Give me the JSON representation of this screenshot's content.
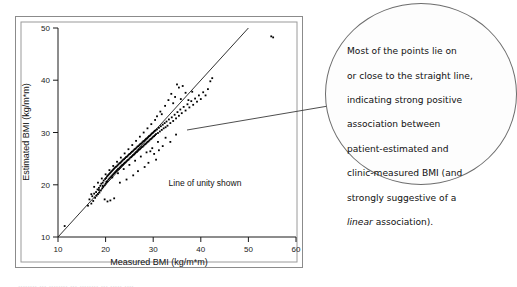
{
  "figure": {
    "background_color": "#ffffff",
    "frame_color": "#8b8b8b",
    "point_color": "#000000"
  },
  "chart_data": {
    "type": "scatter",
    "title": "",
    "xlabel": "Measured BMI (kg/m*m)",
    "ylabel": "Estimated BMI (kg/m*m)",
    "xlim": [
      10,
      60
    ],
    "ylim": [
      10,
      50
    ],
    "xticks": [
      10,
      20,
      30,
      40,
      50,
      60
    ],
    "yticks": [
      10,
      20,
      30,
      40,
      50
    ],
    "grid": false,
    "legend": "",
    "annotations": [
      {
        "text": "Line of unity shown",
        "x": 41,
        "y": 20.5
      }
    ],
    "reference_lines": [
      {
        "name": "line-of-unity",
        "type": "identity",
        "from": [
          10,
          10
        ],
        "to": [
          50,
          50
        ],
        "label": "Line of unity shown"
      }
    ],
    "series": [
      {
        "name": "patient-estimated vs clinic-measured BMI",
        "points": [
          [
            11.4,
            12.1
          ],
          [
            16.3,
            16.0
          ],
          [
            16.6,
            17.2
          ],
          [
            17.0,
            16.4
          ],
          [
            17.2,
            17.8
          ],
          [
            17.4,
            16.9
          ],
          [
            17.6,
            18.3
          ],
          [
            17.8,
            17.5
          ],
          [
            18.0,
            18.6
          ],
          [
            18.1,
            17.9
          ],
          [
            18.3,
            19.1
          ],
          [
            18.4,
            18.2
          ],
          [
            18.6,
            19.4
          ],
          [
            18.7,
            18.5
          ],
          [
            18.9,
            19.8
          ],
          [
            19.0,
            18.9
          ],
          [
            19.1,
            20.2
          ],
          [
            19.3,
            19.3
          ],
          [
            19.4,
            20.4
          ],
          [
            19.5,
            19.6
          ],
          [
            19.6,
            20.8
          ],
          [
            19.8,
            19.9
          ],
          [
            19.9,
            21.1
          ],
          [
            20.0,
            20.2
          ],
          [
            20.1,
            21.3
          ],
          [
            20.2,
            20.5
          ],
          [
            20.3,
            21.6
          ],
          [
            20.4,
            20.7
          ],
          [
            20.5,
            21.8
          ],
          [
            20.6,
            21.0
          ],
          [
            20.7,
            22.0
          ],
          [
            20.8,
            21.2
          ],
          [
            20.9,
            22.2
          ],
          [
            21.0,
            21.4
          ],
          [
            21.1,
            22.4
          ],
          [
            21.2,
            21.6
          ],
          [
            21.3,
            22.6
          ],
          [
            21.4,
            21.8
          ],
          [
            21.5,
            22.8
          ],
          [
            21.6,
            22.0
          ],
          [
            21.7,
            23.0
          ],
          [
            21.8,
            22.2
          ],
          [
            21.9,
            23.2
          ],
          [
            22.0,
            22.4
          ],
          [
            22.1,
            23.4
          ],
          [
            22.2,
            22.6
          ],
          [
            22.3,
            23.5
          ],
          [
            22.4,
            22.8
          ],
          [
            22.5,
            23.7
          ],
          [
            22.6,
            23.0
          ],
          [
            22.7,
            23.9
          ],
          [
            22.8,
            23.1
          ],
          [
            22.9,
            24.1
          ],
          [
            23.0,
            23.3
          ],
          [
            23.1,
            24.2
          ],
          [
            23.2,
            23.5
          ],
          [
            23.3,
            24.4
          ],
          [
            23.4,
            23.7
          ],
          [
            23.5,
            24.6
          ],
          [
            23.6,
            23.8
          ],
          [
            23.7,
            24.8
          ],
          [
            23.8,
            24.0
          ],
          [
            23.9,
            24.9
          ],
          [
            24.0,
            24.2
          ],
          [
            24.1,
            25.1
          ],
          [
            24.2,
            24.3
          ],
          [
            24.3,
            25.3
          ],
          [
            24.4,
            24.5
          ],
          [
            24.5,
            25.4
          ],
          [
            24.6,
            24.7
          ],
          [
            24.7,
            25.6
          ],
          [
            24.8,
            24.8
          ],
          [
            24.9,
            25.8
          ],
          [
            25.0,
            25.0
          ],
          [
            25.1,
            25.9
          ],
          [
            25.2,
            25.2
          ],
          [
            25.3,
            26.1
          ],
          [
            25.4,
            25.3
          ],
          [
            25.5,
            26.3
          ],
          [
            25.6,
            25.5
          ],
          [
            25.7,
            26.4
          ],
          [
            25.8,
            25.7
          ],
          [
            25.9,
            26.6
          ],
          [
            26.0,
            25.8
          ],
          [
            26.1,
            26.8
          ],
          [
            26.2,
            26.0
          ],
          [
            26.3,
            26.9
          ],
          [
            26.4,
            26.2
          ],
          [
            26.5,
            27.1
          ],
          [
            26.6,
            26.3
          ],
          [
            26.7,
            27.3
          ],
          [
            26.8,
            26.5
          ],
          [
            26.9,
            27.4
          ],
          [
            27.0,
            26.7
          ],
          [
            27.1,
            27.6
          ],
          [
            27.2,
            26.8
          ],
          [
            27.3,
            27.8
          ],
          [
            27.4,
            27.0
          ],
          [
            27.5,
            27.9
          ],
          [
            27.6,
            27.2
          ],
          [
            27.7,
            28.1
          ],
          [
            27.8,
            27.3
          ],
          [
            27.9,
            28.3
          ],
          [
            28.0,
            27.5
          ],
          [
            28.1,
            28.4
          ],
          [
            28.2,
            27.7
          ],
          [
            28.3,
            28.6
          ],
          [
            28.4,
            27.8
          ],
          [
            28.5,
            28.8
          ],
          [
            28.6,
            28.0
          ],
          [
            28.7,
            28.9
          ],
          [
            28.8,
            28.2
          ],
          [
            28.9,
            29.1
          ],
          [
            29.0,
            28.3
          ],
          [
            29.1,
            29.3
          ],
          [
            29.2,
            28.5
          ],
          [
            29.3,
            29.4
          ],
          [
            29.4,
            28.7
          ],
          [
            29.5,
            29.6
          ],
          [
            29.6,
            28.8
          ],
          [
            29.7,
            29.8
          ],
          [
            29.8,
            29.0
          ],
          [
            29.9,
            29.9
          ],
          [
            30.0,
            29.2
          ],
          [
            30.1,
            30.1
          ],
          [
            30.2,
            29.3
          ],
          [
            30.3,
            30.3
          ],
          [
            30.4,
            29.5
          ],
          [
            30.5,
            30.4
          ],
          [
            30.6,
            29.7
          ],
          [
            30.8,
            30.6
          ],
          [
            31.0,
            29.9
          ],
          [
            31.2,
            30.9
          ],
          [
            31.4,
            30.2
          ],
          [
            31.6,
            31.2
          ],
          [
            31.8,
            30.5
          ],
          [
            32.0,
            31.5
          ],
          [
            32.2,
            30.8
          ],
          [
            32.4,
            31.8
          ],
          [
            32.6,
            31.0
          ],
          [
            32.8,
            32.1
          ],
          [
            33.0,
            31.3
          ],
          [
            33.3,
            32.5
          ],
          [
            33.6,
            31.8
          ],
          [
            33.9,
            32.9
          ],
          [
            34.2,
            32.2
          ],
          [
            34.5,
            33.4
          ],
          [
            34.8,
            32.7
          ],
          [
            35.1,
            33.9
          ],
          [
            35.4,
            33.2
          ],
          [
            35.7,
            34.4
          ],
          [
            36.0,
            33.7
          ],
          [
            36.4,
            34.9
          ],
          [
            36.8,
            34.2
          ],
          [
            37.2,
            35.4
          ],
          [
            37.6,
            34.8
          ],
          [
            38.0,
            36.0
          ],
          [
            38.4,
            35.3
          ],
          [
            38.8,
            36.5
          ],
          [
            39.2,
            35.9
          ],
          [
            39.6,
            37.1
          ],
          [
            40.0,
            36.4
          ],
          [
            40.5,
            37.7
          ],
          [
            41.0,
            37.1
          ],
          [
            41.5,
            38.3
          ],
          [
            42.0,
            39.8
          ],
          [
            42.4,
            40.4
          ],
          [
            35.0,
            39.2
          ],
          [
            35.4,
            38.6
          ],
          [
            36.2,
            38.9
          ],
          [
            33.8,
            37.4
          ],
          [
            34.6,
            36.8
          ],
          [
            32.5,
            35.1
          ],
          [
            33.2,
            36.2
          ],
          [
            31.5,
            34.0
          ],
          [
            30.8,
            33.1
          ],
          [
            36.8,
            37.6
          ],
          [
            37.4,
            36.2
          ],
          [
            38.2,
            37.8
          ],
          [
            35.8,
            36.4
          ],
          [
            34.2,
            35.6
          ],
          [
            31.8,
            33.5
          ],
          [
            30.4,
            32.4
          ],
          [
            29.6,
            31.6
          ],
          [
            28.8,
            30.8
          ],
          [
            28.0,
            30.0
          ],
          [
            27.2,
            29.2
          ],
          [
            26.4,
            28.4
          ],
          [
            25.6,
            27.6
          ],
          [
            24.8,
            26.8
          ],
          [
            24.0,
            26.0
          ],
          [
            23.2,
            25.2
          ],
          [
            22.4,
            24.4
          ],
          [
            21.6,
            23.6
          ],
          [
            20.8,
            22.8
          ],
          [
            20.0,
            22.0
          ],
          [
            19.2,
            21.2
          ],
          [
            18.4,
            20.4
          ],
          [
            17.6,
            19.6
          ],
          [
            17.0,
            18.2
          ],
          [
            32.0,
            27.4
          ],
          [
            31.2,
            26.6
          ],
          [
            30.2,
            25.9
          ],
          [
            29.4,
            26.4
          ],
          [
            33.6,
            28.2
          ],
          [
            34.8,
            29.6
          ],
          [
            32.6,
            29.0
          ],
          [
            31.0,
            28.2
          ],
          [
            29.8,
            27.0
          ],
          [
            28.6,
            26.2
          ],
          [
            27.4,
            25.4
          ],
          [
            26.2,
            24.6
          ],
          [
            25.0,
            23.8
          ],
          [
            23.8,
            23.0
          ],
          [
            22.6,
            22.2
          ],
          [
            21.4,
            21.4
          ],
          [
            20.2,
            20.6
          ],
          [
            19.4,
            19.8
          ],
          [
            18.6,
            19.0
          ],
          [
            21.0,
            17.0
          ],
          [
            21.8,
            17.4
          ],
          [
            20.4,
            16.8
          ],
          [
            19.8,
            17.2
          ],
          [
            24.4,
            21.0
          ],
          [
            25.8,
            21.8
          ],
          [
            23.0,
            20.4
          ],
          [
            26.8,
            22.6
          ],
          [
            28.2,
            23.4
          ],
          [
            29.0,
            24.2
          ],
          [
            30.6,
            24.8
          ],
          [
            55.2,
            48.2
          ],
          [
            54.8,
            48.4
          ]
        ]
      }
    ]
  },
  "callout": {
    "name": "annotation-bubble",
    "line1": "Most of the points lie on",
    "line2": "or close to the straight line,",
    "line3": "indicating strong positive",
    "line4": "association between",
    "line5": "patient-estimated and",
    "line6": "clinic-measured BMI (and",
    "line7": "strongly suggestive of a",
    "line8_italic": "linear",
    "line8_rest": " association)."
  },
  "caption": {
    "cutoff_text": "........ ... ........ ... ........ ... ..... ...."
  }
}
